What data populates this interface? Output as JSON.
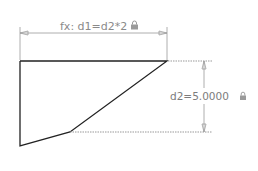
{
  "drawing": {
    "dimensions": [
      {
        "id": "d1",
        "label": "fx: d1=d2*2",
        "locked": true,
        "orientation": "horizontal"
      },
      {
        "id": "d2",
        "label": "d2=5.0000",
        "locked": true,
        "orientation": "vertical"
      }
    ],
    "colors": {
      "geometry": "#222222",
      "dimension": "#9a9a9a",
      "dimension_text": "#8a8a8a"
    }
  }
}
